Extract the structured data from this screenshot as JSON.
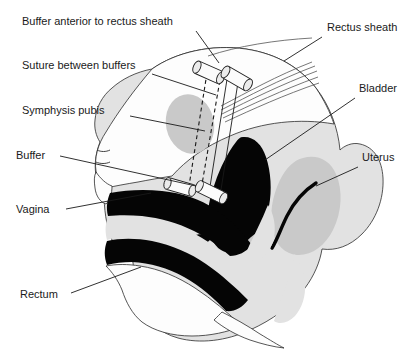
{
  "figure": {
    "background_color": "#ffffff",
    "width": 416,
    "height": 354,
    "ink_color": "#1a1a1a",
    "label_font_size_px": 11
  },
  "labels": [
    {
      "id": "buffer-anterior-to-rectus-sheath",
      "text": "Buffer anterior to rectus sheath",
      "x": 22,
      "y": 25,
      "anchor": "start",
      "leader": "M 196 31 L 219 63"
    },
    {
      "id": "suture-between-buffers",
      "text": "Suture between buffers",
      "x": 22,
      "y": 69,
      "anchor": "start",
      "leader": "M 152 74 L 216 95"
    },
    {
      "id": "symphysis-pubis",
      "text": "Symphysis pubis",
      "x": 22,
      "y": 114,
      "anchor": "start",
      "leader": "M 130 116 L 205 131"
    },
    {
      "id": "buffer",
      "text": "Buffer",
      "x": 16,
      "y": 159,
      "anchor": "start",
      "leader": "M 60 156 L 196 186"
    },
    {
      "id": "vagina",
      "text": "Vagina",
      "x": 16,
      "y": 213,
      "anchor": "start",
      "leader": "M 66 209 L 151 193"
    },
    {
      "id": "rectum",
      "text": "Rectum",
      "x": 20,
      "y": 298,
      "anchor": "start",
      "leader": "M 71 293 L 141 267"
    },
    {
      "id": "rectus-sheath",
      "text": "Rectus sheath",
      "x": 327,
      "y": 31,
      "anchor": "start",
      "leader": "M 322 37 L 284 61"
    },
    {
      "id": "bladder",
      "text": "Bladder",
      "x": 359,
      "y": 92,
      "anchor": "start",
      "leader": "M 355 98 L 265 160"
    },
    {
      "id": "uterus",
      "text": "Uterus",
      "x": 362,
      "y": 161,
      "anchor": "start",
      "leader": "M 358 167 L 316 186"
    }
  ],
  "structures": {
    "abdominal_wall": "anterior abdominal wall outline",
    "symphysis_pubis": "gray ellipse representing pubic bone",
    "bladder": "large black filled region",
    "uterus": "gray oval with dark curved cavity",
    "vagina": "black band below bladder",
    "rectum": "lower black band",
    "rectus_sheath": "parallel curved fascia fibers",
    "buffers": [
      {
        "id": "buffer-upper-left",
        "position": "superior medial"
      },
      {
        "id": "buffer-upper-right",
        "position": "superior lateral"
      },
      {
        "id": "buffer-lower-left",
        "position": "inferior medial"
      },
      {
        "id": "buffer-lower-right",
        "position": "inferior lateral"
      }
    ],
    "sutures": [
      {
        "id": "suture-dashed-medial",
        "style": "dashed"
      },
      {
        "id": "suture-dashed-lateral",
        "style": "dashed"
      },
      {
        "id": "suture-solid-pair",
        "style": "solid"
      }
    ]
  }
}
